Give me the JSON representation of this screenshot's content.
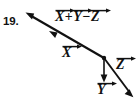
{
  "figure": {
    "problem_number": "19.",
    "canvas": {
      "width": 138,
      "height": 102,
      "background": "#ffffff"
    },
    "stroke_color": "#111111",
    "labels": {
      "resultant_expression": {
        "text": "X + Y - Z",
        "terms": [
          "X",
          "Y",
          "Z"
        ],
        "operators": [
          "+",
          "−"
        ],
        "notation": "vector-arrow"
      },
      "vector_x": "X",
      "vector_y": "Y",
      "vector_z": "Z"
    },
    "vectors": [
      {
        "name": "resultant",
        "label": "X + Y - Z",
        "from": {
          "x": 104,
          "y": 58
        },
        "to": {
          "x": 26,
          "y": 13
        },
        "arrowheads": "start-and-midpoint",
        "direction": "up-left"
      },
      {
        "name": "vector-x",
        "label": "X",
        "from": {
          "x": 104,
          "y": 58
        },
        "to": {
          "x": 26,
          "y": 13
        },
        "direction": "up-left"
      },
      {
        "name": "vector-y",
        "label": "Y",
        "from": {
          "x": 104,
          "y": 58
        },
        "to": {
          "x": 104,
          "y": 82
        },
        "direction": "down"
      },
      {
        "name": "vector-z",
        "label": "Z",
        "from": {
          "x": 104,
          "y": 58
        },
        "to": {
          "x": 133,
          "y": 97
        },
        "direction": "down-right"
      }
    ],
    "junction_point": {
      "x": 104,
      "y": 58
    }
  }
}
